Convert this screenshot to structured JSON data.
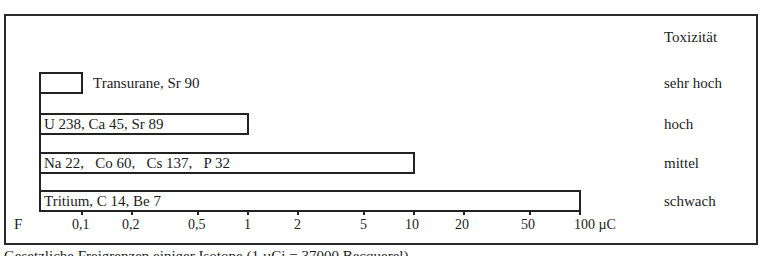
{
  "chart_data": {
    "type": "bar",
    "orientation": "horizontal",
    "xscale": "log",
    "title": "",
    "xlabel": "µC",
    "ylabel": "Toxizität",
    "origin_label": "F",
    "xlim": [
      0.056,
      100
    ],
    "x_ticks": [
      {
        "value": 0.1,
        "label": "0,1"
      },
      {
        "value": 0.2,
        "label": "0,2"
      },
      {
        "value": 0.5,
        "label": "0,5"
      },
      {
        "value": 1,
        "label": "1"
      },
      {
        "value": 2,
        "label": "2"
      },
      {
        "value": 5,
        "label": "5"
      },
      {
        "value": 10,
        "label": "10"
      },
      {
        "value": 20,
        "label": "20"
      },
      {
        "value": 50,
        "label": "50"
      },
      {
        "value": 100,
        "label": "100 µC"
      }
    ],
    "bars": [
      {
        "category": "sehr hoch",
        "isotopes": "Transurane, Sr 90",
        "value": 0.1,
        "label_position": "outside"
      },
      {
        "category": "hoch",
        "isotopes": "U 238, Ca 45, Sr 89",
        "value": 1,
        "label_position": "inside"
      },
      {
        "category": "mittel",
        "isotopes": "Na 22,   Co 60,   Cs 137,   P 32",
        "value": 10,
        "label_position": "inside"
      },
      {
        "category": "schwach",
        "isotopes": "Tritium, C 14, Be 7",
        "value": 100,
        "label_position": "inside"
      }
    ],
    "grid": false,
    "legend": "none"
  },
  "caption": "Gesetzliche Freigrenzen einiger Isotope (1 µCi = 37000 Becquerel)"
}
